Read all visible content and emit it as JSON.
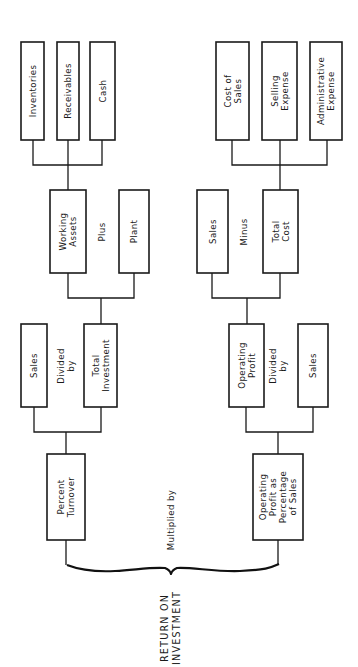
{
  "diagram": {
    "title": [
      "RETURN ON",
      "INVESTMENT"
    ],
    "orientation": "rotated 90 degrees counter-clockwise",
    "combine_operator": "Multiplied by",
    "branches": [
      {
        "name": "turnover",
        "result": [
          "Percent",
          "Turnover"
        ],
        "operator": [
          "Divided",
          "by"
        ],
        "numerator": [
          "Sales"
        ],
        "denominator": [
          "Total",
          "Investment"
        ],
        "investment_breakdown": {
          "operator": "Plus",
          "left": [
            "Working",
            "Assets"
          ],
          "right": [
            "Plant"
          ],
          "working_assets_components": [
            [
              "Inventories"
            ],
            [
              "Receivables"
            ],
            [
              "Cash"
            ]
          ]
        }
      },
      {
        "name": "margin",
        "result": [
          "Operating",
          "Profit as",
          "Percentage",
          "of Sales"
        ],
        "operator": [
          "Divided",
          "by"
        ],
        "numerator": [
          "Operating",
          "Profit"
        ],
        "denominator": [
          "Sales"
        ],
        "profit_breakdown": {
          "operator": "Minus",
          "left": [
            "Sales"
          ],
          "right": [
            "Total",
            "Cost"
          ],
          "cost_components": [
            [
              "Cost of",
              "Sales"
            ],
            [
              "Selling",
              "Expense"
            ],
            [
              "Administrative",
              "Expense"
            ]
          ]
        }
      }
    ]
  }
}
